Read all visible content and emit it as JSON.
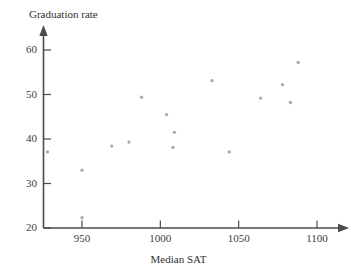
{
  "chart_data": {
    "type": "scatter",
    "title": "",
    "xlabel": "Median SAT",
    "ylabel": "Graduation rate",
    "xlim": [
      920,
      1105
    ],
    "ylim": [
      20,
      62
    ],
    "xticks": [
      950,
      1000,
      1050,
      1100
    ],
    "yticks": [
      20,
      30,
      40,
      50,
      60
    ],
    "xtick_labels": [
      "950",
      "1000",
      "1050",
      "1100"
    ],
    "ytick_labels": [
      "20",
      "30",
      "40",
      "50",
      "60"
    ],
    "grid": false,
    "legend": null,
    "marker": {
      "shape": "circle",
      "color": "#a9a9a9",
      "size": 3.3
    },
    "points": [
      {
        "x": 928,
        "y": 37.1
      },
      {
        "x": 950,
        "y": 33.0
      },
      {
        "x": 950,
        "y": 22.3
      },
      {
        "x": 969,
        "y": 38.4
      },
      {
        "x": 980,
        "y": 39.3
      },
      {
        "x": 988,
        "y": 49.4
      },
      {
        "x": 1004,
        "y": 45.5
      },
      {
        "x": 1009,
        "y": 41.5
      },
      {
        "x": 1008,
        "y": 38.1
      },
      {
        "x": 1033,
        "y": 53.1
      },
      {
        "x": 1044,
        "y": 37.1
      },
      {
        "x": 1064,
        "y": 49.2
      },
      {
        "x": 1078,
        "y": 52.2
      },
      {
        "x": 1083,
        "y": 48.2
      },
      {
        "x": 1088,
        "y": 57.2
      }
    ]
  },
  "axes": {
    "y_title": "Graduation rate",
    "x_title": "Median SAT",
    "y_tick_labels": [
      {
        "value": 20,
        "text": "20"
      },
      {
        "value": 30,
        "text": "30"
      },
      {
        "value": 40,
        "text": "40"
      },
      {
        "value": 50,
        "text": "50"
      },
      {
        "value": 60,
        "text": "60"
      }
    ],
    "x_tick_labels": [
      {
        "value": 950,
        "text": "950"
      },
      {
        "value": 1000,
        "text": "1000"
      },
      {
        "value": 1050,
        "text": "1050"
      },
      {
        "value": 1100,
        "text": "1100"
      }
    ]
  },
  "colors": {
    "axis": "#4a4a4a",
    "marker": "#a9a9a9",
    "text": "#3d3d3d",
    "background": "#ffffff"
  }
}
